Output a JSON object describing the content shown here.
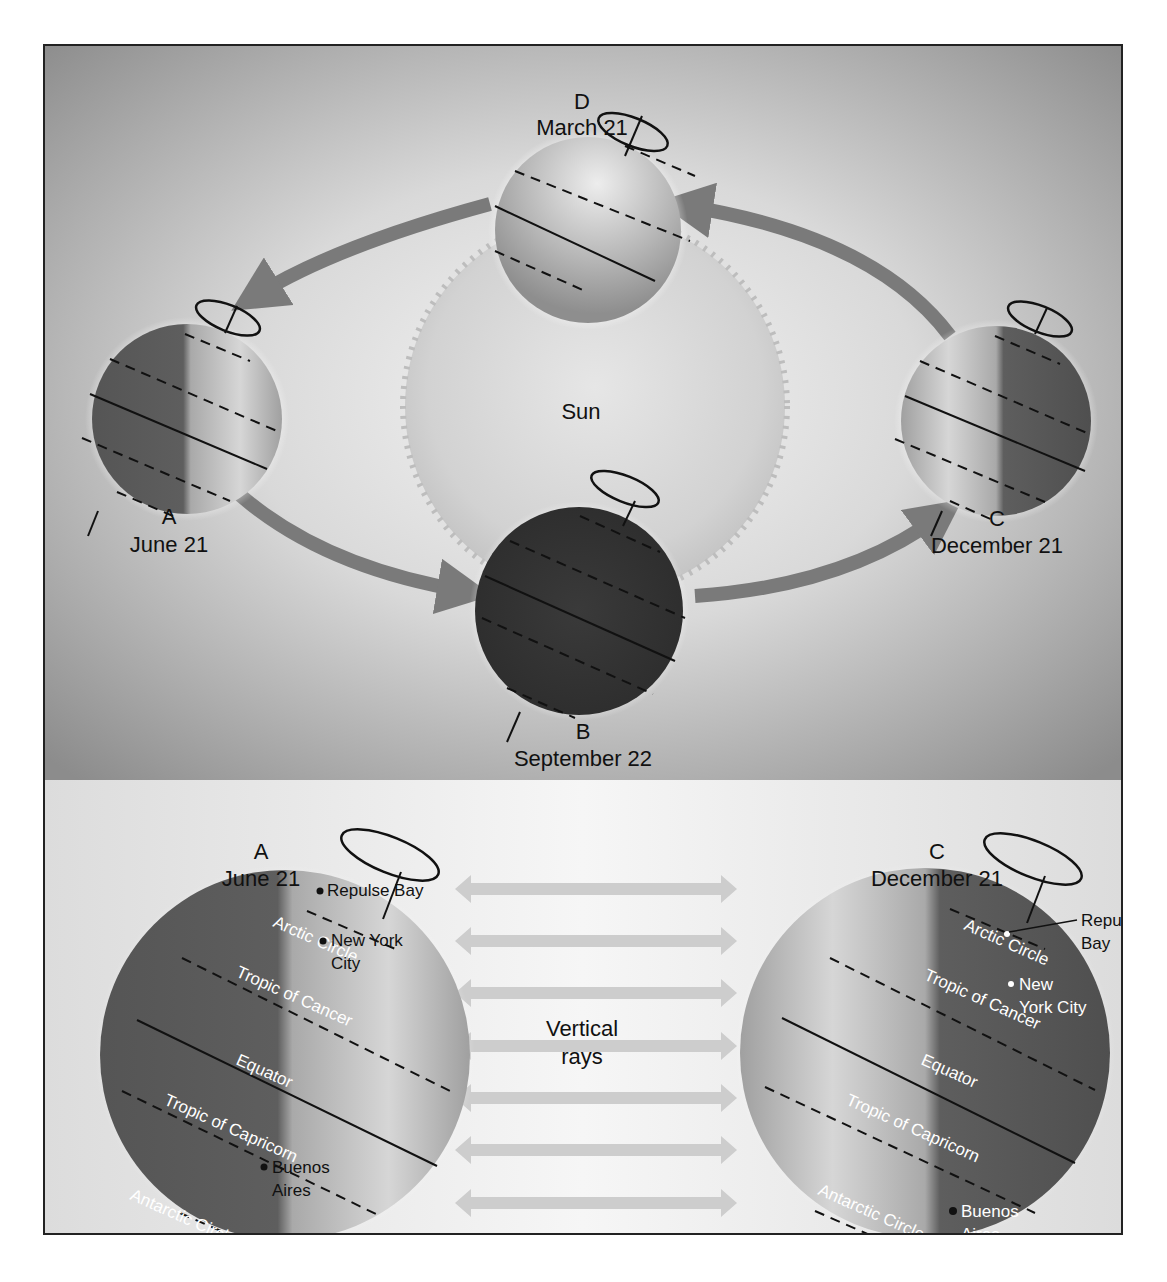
{
  "top_panel": {
    "sun_label": "Sun",
    "positions": [
      {
        "id": "D",
        "letter": "D",
        "date": "March 21"
      },
      {
        "id": "A",
        "letter": "A",
        "date": "June 21"
      },
      {
        "id": "B",
        "letter": "B",
        "date": "September 22"
      },
      {
        "id": "C",
        "letter": "C",
        "date": "December 21"
      }
    ]
  },
  "bottom_panel": {
    "center_label_line1": "Vertical",
    "center_label_line2": "rays",
    "ray_count": 7,
    "left_globe": {
      "letter": "A",
      "date": "June 21",
      "lines": {
        "arctic": "Arctic Circle",
        "cancer": "Tropic of Cancer",
        "equator": "Equator",
        "capricorn": "Tropic of Capricorn",
        "antarctic": "Antarctic Circle"
      },
      "cities": {
        "repulse_bay": "Repulse Bay",
        "nyc_line1": "New York",
        "nyc_line2": "City",
        "ba_line1": "Buenos",
        "ba_line2": "Aires"
      }
    },
    "right_globe": {
      "letter": "C",
      "date": "December 21",
      "lines": {
        "arctic": "Arctic Circle",
        "cancer": "Tropic of Cancer",
        "equator": "Equator",
        "capricorn": "Tropic of Capricorn",
        "antarctic": "Antarctic Circle"
      },
      "cities": {
        "repulse_line1": "Repulse",
        "repulse_line2": "Bay",
        "nyc_line1": "New",
        "nyc_line2": "York City",
        "ba_line1": "Buenos",
        "ba_line2": "Aires"
      }
    }
  },
  "colors": {
    "top_bg": "#8f8f8f",
    "bottom_bg": "#ededed",
    "globe_dark": "#3a3a3a",
    "globe_mid": "#6b6b6b",
    "globe_light": "#c8c8c8",
    "arrow": "#7a7a7a",
    "ray": "#cfcfcf",
    "border": "#222222"
  }
}
